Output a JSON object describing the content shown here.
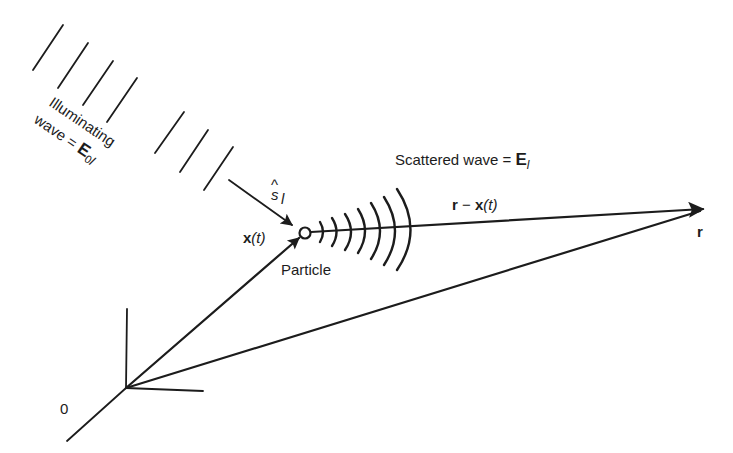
{
  "diagram": {
    "labels": {
      "illuminating_line1": "Illuminating",
      "illuminating_line2_prefix": "wave = ",
      "illuminating_field": "E",
      "illuminating_sub": "0",
      "illuminating_sub2": "l",
      "scattered_prefix": "Scattered wave = ",
      "scattered_field": "E",
      "scattered_sub": "l",
      "unit_vector": "s",
      "unit_vector_hat": "^",
      "unit_vector_sub": "l",
      "position_vector": "x",
      "position_arg": "(t)",
      "particle": "Particle",
      "relative_vector_r": "r",
      "relative_vector_minus": " − ",
      "relative_vector_x": "x",
      "relative_vector_arg": "(t)",
      "detector_point": "r",
      "origin": "0"
    },
    "elements": {
      "incident_wavefronts_count": 7,
      "scattered_wavefronts_count": 7,
      "origin": [
        126,
        388
      ],
      "particle": [
        305,
        233
      ],
      "detector": [
        703,
        209
      ]
    },
    "colors": {
      "ink": "#1c1c1c",
      "background": "#ffffff"
    }
  }
}
